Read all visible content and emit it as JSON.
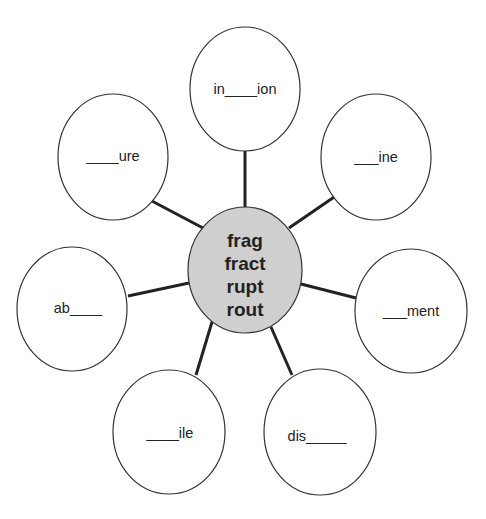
{
  "diagram": {
    "type": "word-web",
    "colors": {
      "background": "#ffffff",
      "center_fill": "#cfcfcf",
      "outline": "#333333",
      "connector": "#222222",
      "text": "#222222"
    },
    "center": {
      "roots": [
        "frag",
        "fract",
        "rupt",
        "rout"
      ]
    },
    "nodes": [
      {
        "id": "top",
        "label": "in____ion"
      },
      {
        "id": "upper-right",
        "label": "___ine"
      },
      {
        "id": "right",
        "label": "___ment"
      },
      {
        "id": "bottom-right",
        "label": "dis_____"
      },
      {
        "id": "bottom-left",
        "label": "____ile"
      },
      {
        "id": "left",
        "label": "ab____"
      },
      {
        "id": "upper-left",
        "label": "____ure"
      }
    ]
  }
}
